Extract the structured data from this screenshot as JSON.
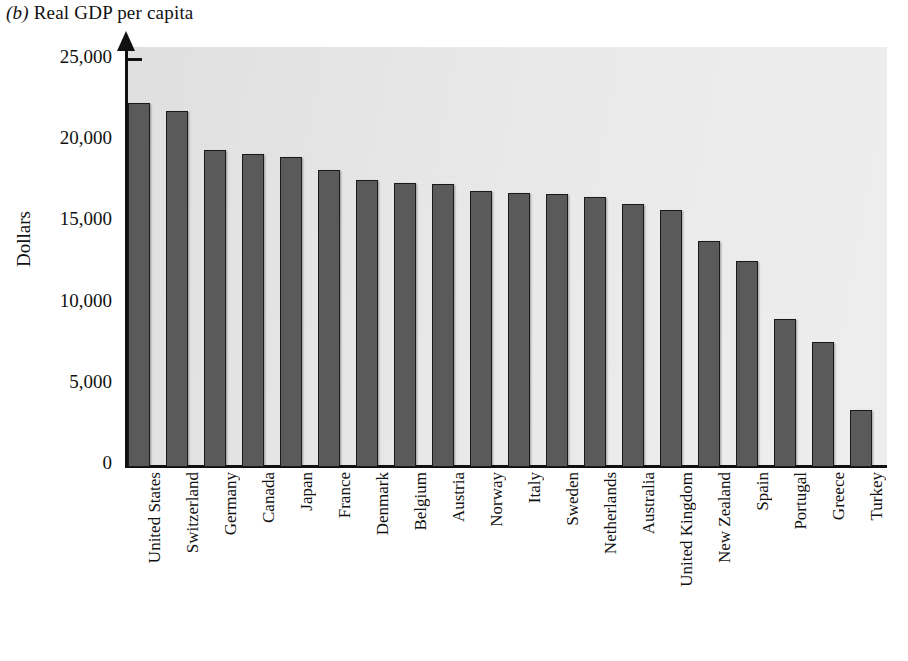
{
  "figure": {
    "panel_letter": "(b)",
    "title": "Real GDP per capita",
    "background_color": "#ececec",
    "bar_color": "#5a5a5a",
    "bar_outline_color": "#1a1a1a"
  },
  "axes": {
    "y_title": "Dollars",
    "y_ticks": [
      "25,000",
      "20,000",
      "15,000",
      "10,000",
      "5,000",
      "0"
    ]
  },
  "chart_data": {
    "type": "bar",
    "title": "(b) Real GDP per capita",
    "xlabel": "",
    "ylabel": "Dollars",
    "ylim": [
      0,
      25000
    ],
    "ytick_values": [
      0,
      5000,
      10000,
      15000,
      20000,
      25000
    ],
    "grid": false,
    "legend": "none",
    "orientation": "vertical",
    "categories": [
      "United States",
      "Switzerland",
      "Germany",
      "Canada",
      "Japan",
      "France",
      "Denmark",
      "Belgium",
      "Austria",
      "Norway",
      "Italy",
      "Sweden",
      "Netherlands",
      "Australia",
      "United Kingdom",
      "New Zealand",
      "Spain",
      "Portugal",
      "Greece",
      "Turkey"
    ],
    "values": [
      22400,
      21900,
      19500,
      19300,
      19100,
      18300,
      17700,
      17500,
      17400,
      17000,
      16900,
      16800,
      16600,
      16200,
      15800,
      13900,
      12700,
      9100,
      7700,
      3500
    ]
  }
}
